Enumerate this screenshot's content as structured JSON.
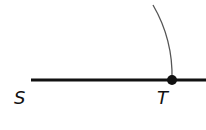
{
  "diagram": {
    "type": "geometric-construction",
    "colors": {
      "line": "#111111",
      "arc": "#555555",
      "point": "#111111",
      "background": "#ffffff"
    },
    "points": [
      {
        "id": "S",
        "label": "S",
        "x": 31,
        "y": 80
      },
      {
        "id": "T",
        "label": "T",
        "x": 172,
        "y": 80
      }
    ],
    "labels": {
      "S": "S",
      "T": "T"
    }
  }
}
